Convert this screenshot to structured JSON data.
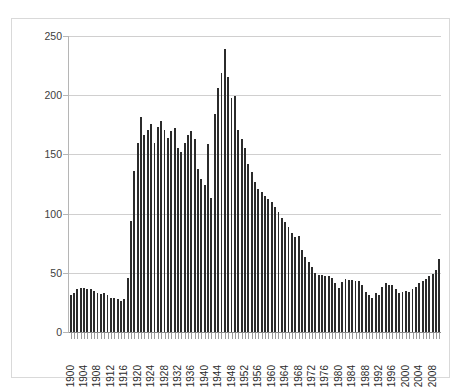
{
  "top_clipped_text": "",
  "chart_data": {
    "type": "bar",
    "title": "",
    "subtitle": "",
    "xlabel": "",
    "ylabel": "",
    "ylim": [
      0,
      250
    ],
    "ytick_values": [
      0,
      50,
      100,
      150,
      200,
      250
    ],
    "ytick_labels": [
      "0",
      "50",
      "100",
      "150",
      "200",
      "250"
    ],
    "grid": true,
    "grid_axis": "y",
    "legend": false,
    "legend_position": "none",
    "bar_color": "#2b2b2b",
    "xtick_interval_years": 4,
    "xtick_labels": [
      "1900",
      "1904",
      "1908",
      "1912",
      "1916",
      "1920",
      "1924",
      "1928",
      "1932",
      "1936",
      "1940",
      "1944",
      "1948",
      "1952",
      "1956",
      "1960",
      "1964",
      "1968",
      "1972",
      "1976",
      "1980",
      "1984",
      "1988",
      "1992",
      "1996",
      "2000",
      "2004",
      "2008"
    ],
    "categories": [
      "1900",
      "1901",
      "1902",
      "1903",
      "1904",
      "1905",
      "1906",
      "1907",
      "1908",
      "1909",
      "1910",
      "1911",
      "1912",
      "1913",
      "1914",
      "1915",
      "1916",
      "1917",
      "1918",
      "1919",
      "1920",
      "1921",
      "1922",
      "1923",
      "1924",
      "1925",
      "1926",
      "1927",
      "1928",
      "1929",
      "1930",
      "1931",
      "1932",
      "1933",
      "1934",
      "1935",
      "1936",
      "1937",
      "1938",
      "1939",
      "1940",
      "1941",
      "1942",
      "1943",
      "1944",
      "1945",
      "1946",
      "1947",
      "1948",
      "1949",
      "1950",
      "1951",
      "1952",
      "1953",
      "1954",
      "1955",
      "1956",
      "1957",
      "1958",
      "1959",
      "1960",
      "1961",
      "1962",
      "1963",
      "1964",
      "1965",
      "1966",
      "1967",
      "1968",
      "1969",
      "1970",
      "1971",
      "1972",
      "1973",
      "1974",
      "1975",
      "1976",
      "1977",
      "1978",
      "1979",
      "1980",
      "1981",
      "1982",
      "1983",
      "1984",
      "1985",
      "1986",
      "1987",
      "1988",
      "1989",
      "1990",
      "1991",
      "1992",
      "1993",
      "1994",
      "1995",
      "1996",
      "1997",
      "1998",
      "1999",
      "2000",
      "2001",
      "2002",
      "2003",
      "2004",
      "2005",
      "2006",
      "2007",
      "2008",
      "2009",
      "2010"
    ],
    "values": [
      31,
      33,
      36,
      37,
      37,
      36,
      36,
      35,
      33,
      32,
      33,
      31,
      29,
      29,
      28,
      26,
      28,
      46,
      94,
      136,
      160,
      182,
      166,
      171,
      176,
      160,
      173,
      178,
      171,
      164,
      170,
      172,
      155,
      152,
      160,
      166,
      170,
      163,
      138,
      129,
      124,
      159,
      113,
      184,
      206,
      219,
      239,
      215,
      198,
      199,
      171,
      163,
      155,
      142,
      135,
      127,
      121,
      118,
      115,
      112,
      110,
      106,
      101,
      96,
      93,
      89,
      84,
      80,
      81,
      69,
      63,
      59,
      55,
      50,
      48,
      48,
      47,
      47,
      46,
      41,
      37,
      42,
      45,
      44,
      44,
      43,
      43,
      40,
      34,
      31,
      29,
      33,
      31,
      38,
      41,
      40,
      40,
      36,
      33,
      34,
      35,
      34,
      36,
      38,
      41,
      43,
      45,
      47,
      49,
      52,
      62
    ]
  }
}
